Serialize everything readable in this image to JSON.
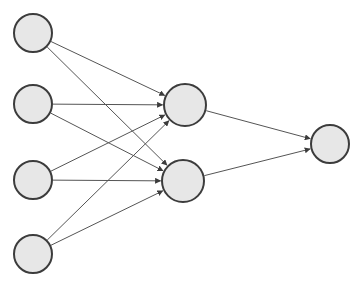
{
  "diagram": {
    "type": "node-link-graph",
    "canvas": {
      "width": 363,
      "height": 293,
      "background": "#ffffff"
    },
    "style": {
      "node_fill": "#e7e7e7",
      "node_stroke": "#3c3c3c",
      "node_stroke_width": 2,
      "edge_stroke": "#555555",
      "edge_stroke_width": 1,
      "arrow_fill": "#3c3c3c"
    },
    "layers": [
      {
        "name": "input-layer",
        "index": 0,
        "node_count": 4,
        "nodes": [
          {
            "id": "i1",
            "label": "",
            "cx": 33,
            "cy": 33,
            "r": 19
          },
          {
            "id": "i2",
            "label": "",
            "cx": 33,
            "cy": 104,
            "r": 19
          },
          {
            "id": "i3",
            "label": "",
            "cx": 33,
            "cy": 180,
            "r": 19
          },
          {
            "id": "i4",
            "label": "",
            "cx": 33,
            "cy": 254,
            "r": 19
          }
        ]
      },
      {
        "name": "hidden-layer",
        "index": 1,
        "node_count": 2,
        "nodes": [
          {
            "id": "h1",
            "label": "",
            "cx": 185,
            "cy": 105,
            "r": 21
          },
          {
            "id": "h2",
            "label": "",
            "cx": 183,
            "cy": 181,
            "r": 21
          }
        ]
      },
      {
        "name": "output-layer",
        "index": 2,
        "node_count": 1,
        "nodes": [
          {
            "id": "o1",
            "label": "",
            "cx": 330,
            "cy": 144,
            "r": 19
          }
        ]
      }
    ],
    "edges": [
      {
        "id": "e-i1-h1",
        "from": "i1",
        "to": "h1",
        "directed": true
      },
      {
        "id": "e-i1-h2",
        "from": "i1",
        "to": "h2",
        "directed": true
      },
      {
        "id": "e-i2-h1",
        "from": "i2",
        "to": "h1",
        "directed": true
      },
      {
        "id": "e-i2-h2",
        "from": "i2",
        "to": "h2",
        "directed": true
      },
      {
        "id": "e-i3-h1",
        "from": "i3",
        "to": "h1",
        "directed": true
      },
      {
        "id": "e-i3-h2",
        "from": "i3",
        "to": "h2",
        "directed": true
      },
      {
        "id": "e-i4-h1",
        "from": "i4",
        "to": "h1",
        "directed": true
      },
      {
        "id": "e-i4-h2",
        "from": "i4",
        "to": "h2",
        "directed": true
      },
      {
        "id": "e-h1-o1",
        "from": "h1",
        "to": "o1",
        "directed": true
      },
      {
        "id": "e-h2-o1",
        "from": "h2",
        "to": "o1",
        "directed": true
      }
    ]
  }
}
